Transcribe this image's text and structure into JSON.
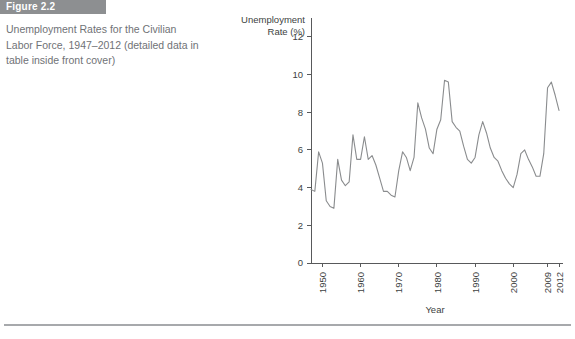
{
  "figure": {
    "label": "Figure 2.2",
    "caption": "Unemployment Rates for the Civilian Labor Force, 1947–2012 (detailed data in table inside front cover)",
    "label_bar_color": "#8d8f91",
    "caption_color": "#6f7276"
  },
  "chart_data": {
    "type": "line",
    "title": "",
    "xlabel": "Year",
    "ylabel": "Unemployment Rate (%)",
    "ylabel_line1": "Unemployment",
    "ylabel_line2": "Rate (%)",
    "xlim": [
      1947,
      2012
    ],
    "ylim": [
      0,
      12
    ],
    "yticks": [
      0,
      2,
      4,
      6,
      8,
      10,
      12
    ],
    "ytick_labels": [
      "0",
      "2",
      "4",
      "6",
      "8",
      "10",
      "12"
    ],
    "xticks": [
      1950,
      1960,
      1970,
      1980,
      1990,
      2000,
      2009,
      2012
    ],
    "xtick_labels": [
      "1950",
      "1960",
      "1970",
      "1980",
      "1990",
      "2000",
      "2009",
      "2012"
    ],
    "xtick_rotation": -90,
    "grid": false,
    "legend": false,
    "line_color": "#8a8c8e",
    "axis_color": "#58595b",
    "series": [
      {
        "name": "Civilian unemployment rate",
        "x": [
          1947,
          1948,
          1949,
          1950,
          1951,
          1952,
          1953,
          1954,
          1955,
          1956,
          1957,
          1958,
          1959,
          1960,
          1961,
          1962,
          1963,
          1964,
          1965,
          1966,
          1967,
          1968,
          1969,
          1970,
          1971,
          1972,
          1973,
          1974,
          1975,
          1976,
          1977,
          1978,
          1979,
          1980,
          1981,
          1982,
          1983,
          1984,
          1985,
          1986,
          1987,
          1988,
          1989,
          1990,
          1991,
          1992,
          1993,
          1994,
          1995,
          1996,
          1997,
          1998,
          1999,
          2000,
          2001,
          2002,
          2003,
          2004,
          2005,
          2006,
          2007,
          2008,
          2009,
          2010,
          2011,
          2012
        ],
        "values": [
          3.9,
          3.8,
          5.9,
          5.3,
          3.3,
          3.0,
          2.9,
          5.5,
          4.4,
          4.1,
          4.3,
          6.8,
          5.5,
          5.5,
          6.7,
          5.5,
          5.7,
          5.2,
          4.5,
          3.8,
          3.8,
          3.6,
          3.5,
          4.9,
          5.9,
          5.6,
          4.9,
          5.6,
          8.5,
          7.7,
          7.1,
          6.1,
          5.8,
          7.1,
          7.6,
          9.7,
          9.6,
          7.5,
          7.2,
          7.0,
          6.2,
          5.5,
          5.3,
          5.6,
          6.8,
          7.5,
          6.9,
          6.1,
          5.6,
          5.4,
          4.9,
          4.5,
          4.2,
          4.0,
          4.7,
          5.8,
          6.0,
          5.5,
          5.1,
          4.6,
          4.6,
          5.8,
          9.3,
          9.6,
          8.9,
          8.1
        ]
      }
    ]
  }
}
